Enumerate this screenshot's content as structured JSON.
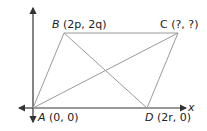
{
  "diagram": {
    "type": "coordinate-geometry parallelogram",
    "axes": {
      "x_label": "x"
    },
    "vertices": {
      "A": {
        "name": "A",
        "coords": "(0, 0)",
        "px": [
          33,
          108
        ]
      },
      "B": {
        "name": "B",
        "coords": "(2p, 2q)",
        "px": [
          64,
          33
        ]
      },
      "C": {
        "name": "C",
        "coords": "(?, ?)",
        "px": [
          178,
          33
        ]
      },
      "D": {
        "name": "D",
        "coords": "(2r, 0)",
        "px": [
          147,
          108
        ]
      }
    },
    "labels": {
      "A": "A (0, 0)",
      "B": "B (2p, 2q)",
      "C": "C (?, ?)",
      "D": "D (2r, 0)"
    },
    "edges": [
      "AB",
      "BC",
      "CD",
      "DA"
    ],
    "diagonals": [
      "AC",
      "BD"
    ],
    "colors": {
      "axis": "#333333",
      "edge": "#9a9a9a",
      "text": "#222222"
    }
  }
}
